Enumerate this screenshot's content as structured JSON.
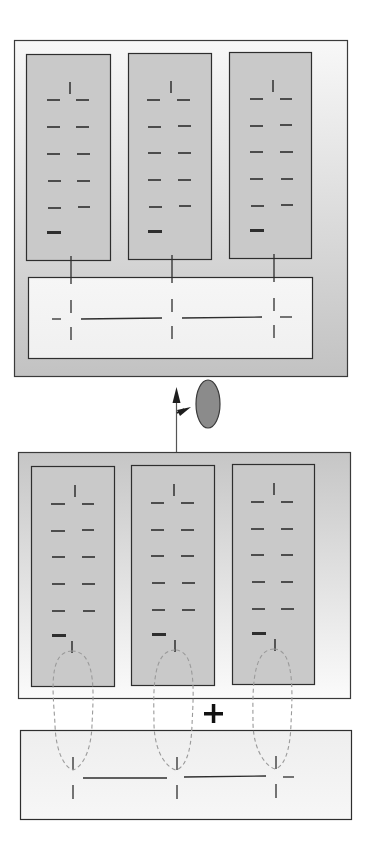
{
  "diagram": {
    "colors": {
      "stroke": "#2e2e2e",
      "column_fill": "#c8c8c8",
      "panel_light": "#f6f6f6",
      "panel_dark": "#c4c4c4",
      "strip_fill": "#f4f4f4",
      "ellipse_fill": "#8a8a8a",
      "dashed": "#9a9a9a"
    },
    "top_panel": {
      "label": "assembled complex",
      "columns": 3,
      "rows_per_column": 5,
      "connectors": 3
    },
    "transition": {
      "arrow": "up-arrow",
      "secondary_arrow": "diagonal-arrow",
      "ellipse": "gray-oval"
    },
    "bottom_panel": {
      "label": "separate components",
      "columns": 3,
      "rows_per_column": 5,
      "dashed_loops": 3
    },
    "operator": "+",
    "backbone_strip": {
      "label": "backbone",
      "nodes": 3
    }
  }
}
